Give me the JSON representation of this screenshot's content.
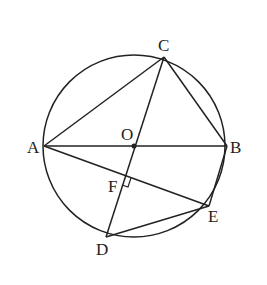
{
  "diagram": {
    "type": "circle-geometry",
    "circle": {
      "center": "O",
      "cx": 134,
      "cy": 146,
      "r": 91
    },
    "points": {
      "A": {
        "x": 44,
        "y": 146,
        "label": "A"
      },
      "B": {
        "x": 227,
        "y": 146,
        "label": "B"
      },
      "C": {
        "x": 164,
        "y": 57,
        "label": "C"
      },
      "O": {
        "x": 134,
        "y": 146,
        "label": "O"
      },
      "D": {
        "x": 106,
        "y": 237,
        "label": "D"
      },
      "E": {
        "x": 209,
        "y": 206,
        "label": "E"
      },
      "F": {
        "x": 125,
        "y": 176,
        "label": "F"
      }
    },
    "segments": [
      "AB",
      "AC",
      "BC",
      "CD",
      "AE",
      "DE",
      "BE"
    ],
    "annotations": {
      "right_angle_at": "F",
      "right_angle_between": [
        "CD",
        "AE"
      ]
    },
    "stroke_color": "#222222"
  }
}
